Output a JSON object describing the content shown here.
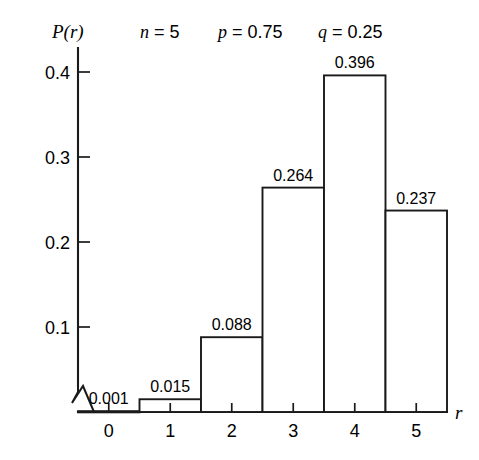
{
  "chart_data": {
    "type": "bar",
    "title": "",
    "xlabel": "r",
    "ylabel": "P(r)",
    "categories": [
      "0",
      "1",
      "2",
      "3",
      "4",
      "5"
    ],
    "values": [
      0.001,
      0.015,
      0.088,
      0.264,
      0.396,
      0.237
    ],
    "value_labels": [
      "0.001",
      "0.015",
      "0.088",
      "0.264",
      "0.396",
      "0.237"
    ],
    "ylim": [
      0,
      0.44
    ],
    "xlim": [
      -0.5,
      5.5
    ],
    "ytick_labels": [
      "0.1",
      "0.2",
      "0.3",
      "0.4"
    ],
    "ytick_values": [
      0.1,
      0.2,
      0.3,
      0.4
    ],
    "grid": false,
    "legend": null,
    "bar_style": "outline-only",
    "axis_break": "zigzag-at-origin",
    "annotations": [
      {
        "symbol": "n",
        "equals": "=",
        "value": "5"
      },
      {
        "symbol": "p",
        "equals": "=",
        "value": "0.75"
      },
      {
        "symbol": "q",
        "equals": "=",
        "value": "0.25"
      }
    ]
  },
  "style": {
    "background": "#ffffff",
    "ink": "#1a1a1a"
  }
}
